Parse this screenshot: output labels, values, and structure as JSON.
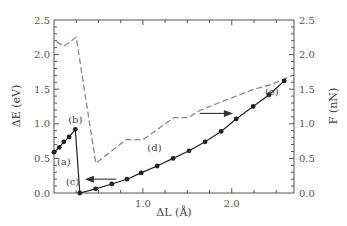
{
  "chart_data": {
    "type": "line",
    "title": "",
    "xlabel": "ΔL (Å)",
    "ylabel": "ΔE (eV)",
    "y2label": "F (nN)",
    "xlim": [
      0,
      2.7
    ],
    "ylim": [
      0,
      2.5
    ],
    "y2lim": [
      0,
      2.5
    ],
    "x_ticks": [
      1.0,
      2.0
    ],
    "x_tick_labels": [
      "1.0",
      "2.0"
    ],
    "y_ticks": [
      0.0,
      0.5,
      1.0,
      1.5,
      2.0,
      2.5
    ],
    "y_tick_labels": [
      "0.0",
      "0.5",
      "1.0",
      "1.5",
      "2.0",
      "2.5"
    ],
    "y2_ticks": [
      0.0,
      0.5,
      1.0,
      1.5,
      2.0,
      2.5
    ],
    "y2_tick_labels": [
      "0.0",
      "0.5",
      "1.0",
      "1.5",
      "2.0",
      "2.5"
    ],
    "grid": false,
    "legend": null,
    "series": [
      {
        "name": "ΔE (energy)",
        "axis": "left",
        "style": "solid-with-markers",
        "color": "#222222",
        "x": [
          0.0,
          0.06,
          0.11,
          0.17,
          0.24,
          0.29,
          0.47,
          0.65,
          0.82,
          0.98,
          1.16,
          1.34,
          1.52,
          1.7,
          1.88,
          2.05,
          2.24,
          2.42,
          2.59
        ],
        "y": [
          0.59,
          0.66,
          0.74,
          0.81,
          0.92,
          0.0,
          0.06,
          0.13,
          0.2,
          0.29,
          0.39,
          0.5,
          0.61,
          0.74,
          0.89,
          1.07,
          1.25,
          1.42,
          1.62
        ]
      },
      {
        "name": "F (force)",
        "axis": "right",
        "style": "dashed",
        "color": "#888888",
        "x": [
          0.03,
          0.11,
          0.25,
          0.47,
          0.81,
          1.0,
          1.35,
          1.51,
          1.65,
          1.85,
          2.05,
          2.25,
          2.45,
          2.68
        ],
        "y": [
          2.19,
          2.12,
          2.25,
          0.43,
          0.77,
          0.77,
          1.09,
          1.09,
          1.2,
          1.3,
          1.4,
          1.5,
          1.57,
          1.7
        ]
      }
    ],
    "annotations": [
      {
        "text": "(a)",
        "x": 0.11,
        "y": 0.45
      },
      {
        "text": "(b)",
        "x": 0.24,
        "y": 1.06
      },
      {
        "text": "(c)",
        "x": 0.21,
        "y": 0.17
      },
      {
        "text": "(d)",
        "x": 1.13,
        "y": 0.66
      },
      {
        "text": "(e)",
        "x": 2.45,
        "y": 1.47
      }
    ],
    "arrows": [
      {
        "direction": "left",
        "from": [
          0.7,
          0.2
        ],
        "to": [
          0.37,
          0.2
        ],
        "meaning": "ΔE curve reads on left axis"
      },
      {
        "direction": "right",
        "from": [
          1.64,
          1.15
        ],
        "to": [
          1.99,
          1.15
        ],
        "meaning": "F curve reads on right axis"
      }
    ]
  }
}
